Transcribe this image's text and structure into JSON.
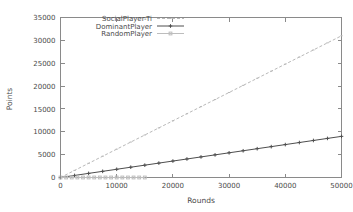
{
  "chart_data": {
    "type": "line",
    "title": "",
    "xlabel": "Rounds",
    "ylabel": "Points",
    "xlim": [
      0,
      50000
    ],
    "ylim": [
      0,
      35000
    ],
    "xticks": [
      0,
      10000,
      20000,
      30000,
      40000,
      50000
    ],
    "yticks": [
      0,
      5000,
      10000,
      15000,
      20000,
      25000,
      30000,
      35000
    ],
    "xtick_labels": [
      "0",
      "10000",
      "20000",
      "30000",
      "40000",
      "50000"
    ],
    "ytick_labels": [
      "0",
      "5000",
      "10000",
      "15000",
      "20000",
      "25000",
      "30000",
      "35000"
    ],
    "grid": false,
    "legend_position": "top-left-inside",
    "series": [
      {
        "name": "SocialPlayer-Ti",
        "color": "#b9b9b9",
        "style": "dashed",
        "marker": "dot",
        "x": [
          0,
          2500,
          5000,
          7500,
          10000,
          12500,
          15000,
          17500,
          20000,
          22500,
          25000,
          27500,
          30000,
          32500,
          35000,
          37500,
          40000,
          42500,
          45000,
          47500,
          50000
        ],
        "values": [
          0,
          1550,
          3100,
          4650,
          6200,
          7750,
          9300,
          10850,
          12400,
          13950,
          15500,
          17050,
          18600,
          20150,
          21700,
          23250,
          24800,
          26350,
          27900,
          29450,
          31000
        ]
      },
      {
        "name": "DominantPlayer",
        "color": "#4e4e4e",
        "style": "solid",
        "marker": "plus",
        "x": [
          0,
          2500,
          5000,
          7500,
          10000,
          12500,
          15000,
          17500,
          20000,
          22500,
          25000,
          27500,
          30000,
          32500,
          35000,
          37500,
          40000,
          42500,
          45000,
          47500,
          50000
        ],
        "values": [
          0,
          450,
          900,
          1350,
          1800,
          2250,
          2700,
          3150,
          3600,
          4050,
          4500,
          4950,
          5400,
          5850,
          6300,
          6750,
          7200,
          7650,
          8100,
          8550,
          9000
        ]
      },
      {
        "name": "RandomPlayer",
        "color": "#bdbdbd",
        "style": "solid",
        "marker": "square",
        "x": [
          0,
          1000,
          2000,
          3000,
          4000,
          5000,
          6000,
          7000,
          8000,
          9000,
          10000,
          11000,
          12000,
          13000,
          14000,
          15000
        ],
        "values": [
          0,
          0,
          0,
          0,
          0,
          0,
          0,
          0,
          0,
          0,
          0,
          0,
          0,
          0,
          0,
          0
        ]
      }
    ]
  },
  "legend": {
    "entries": [
      {
        "label": "SocialPlayer-Ti"
      },
      {
        "label": "DominantPlayer"
      },
      {
        "label": "RandomPlayer"
      }
    ]
  }
}
